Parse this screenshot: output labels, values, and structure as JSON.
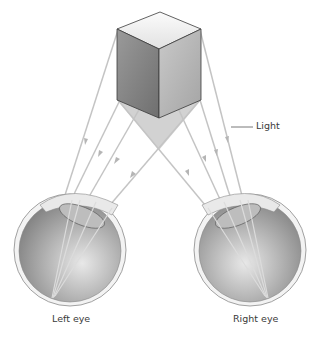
{
  "diagram": {
    "labels": {
      "light": "Light",
      "left_eye": "Left eye",
      "right_eye": "Right eye"
    },
    "colors": {
      "ray": "#c4c4c4",
      "cube_top": "#efefef",
      "cube_left": "#8a8a8a",
      "cube_right": "#b8b8b8",
      "shadow": "#d2d2d2",
      "eye_outer": "#e6e6e6",
      "eye_inner": "#9a9a9a",
      "leader_line": "#555555"
    }
  }
}
